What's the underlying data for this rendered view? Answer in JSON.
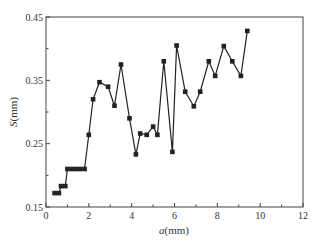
{
  "chart_data": {
    "type": "line",
    "title": "",
    "xlabel": "a(mm)",
    "xlabel_italic": "a",
    "xlabel_unit": "(mm)",
    "ylabel": "S(mm)",
    "ylabel_italic": "S",
    "ylabel_unit": "(mm)",
    "xlim": [
      0,
      12
    ],
    "ylim": [
      0.15,
      0.45
    ],
    "xticks": [
      0,
      2,
      4,
      6,
      8,
      10,
      12
    ],
    "xtick_labels": [
      "0",
      "2",
      "4",
      "6",
      "8",
      "10",
      "12"
    ],
    "yticks": [
      0.15,
      0.25,
      0.35,
      0.45
    ],
    "ytick_labels": [
      "0.15",
      "0.25",
      "0.35",
      "0.45"
    ],
    "x_minor_ticks": [
      1,
      3,
      5,
      7,
      9,
      11
    ],
    "y_minor_ticks": [
      0.2,
      0.3,
      0.4
    ],
    "grid": false,
    "legend": null,
    "marker": "square",
    "line_color": "#222222",
    "series": [
      {
        "name": "S",
        "x": [
          0.4,
          0.6,
          0.7,
          0.9,
          1.0,
          1.2,
          1.4,
          1.6,
          1.8,
          2.0,
          2.2,
          2.5,
          2.9,
          3.2,
          3.5,
          3.9,
          4.2,
          4.4,
          4.7,
          5.0,
          5.2,
          5.5,
          5.9,
          6.1,
          6.5,
          6.9,
          7.2,
          7.6,
          7.9,
          8.3,
          8.7,
          9.1,
          9.4
        ],
        "values": [
          0.172,
          0.172,
          0.183,
          0.183,
          0.21,
          0.21,
          0.21,
          0.21,
          0.21,
          0.264,
          0.32,
          0.347,
          0.34,
          0.31,
          0.375,
          0.29,
          0.233,
          0.266,
          0.264,
          0.277,
          0.264,
          0.38,
          0.237,
          0.405,
          0.332,
          0.309,
          0.332,
          0.38,
          0.357,
          0.404,
          0.38,
          0.357,
          0.428
        ]
      }
    ]
  }
}
